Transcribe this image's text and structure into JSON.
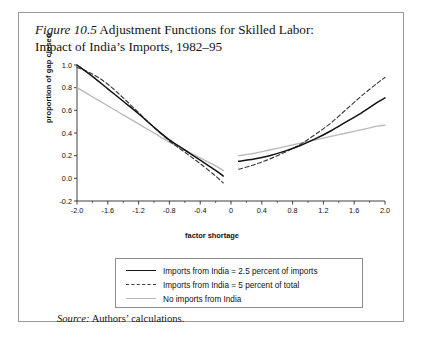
{
  "figure": {
    "number_label": "Figure 10.5",
    "title_line1": " Adjustment Functions for Skilled Labor:",
    "title_line2": "Impact of India’s Imports, 1982–95",
    "source_word": "Source:",
    "source_text": " Authors’ calculations."
  },
  "legend": {
    "items": [
      {
        "label": "Imports from India = 2.5 percent of imports",
        "style": "solid",
        "color": "#121212"
      },
      {
        "label": "Imports from India = 5 percent of total",
        "style": "dashed",
        "color": "#3a3a3a"
      },
      {
        "label": "No imports from India",
        "style": "solid",
        "color": "#b9b9b9"
      }
    ]
  },
  "chart_data": {
    "type": "line",
    "title": "Figure 10.5 Adjustment Functions for Skilled Labor: Impact of India’s Imports, 1982–95",
    "xlabel": "factor shortage",
    "ylabel": "proportion of gap closed",
    "xlim": [
      -2.0,
      2.0
    ],
    "ylim": [
      -0.2,
      1.0
    ],
    "xticks": [
      "-2.0",
      "-1.6",
      "-1.2",
      "-0.8",
      "-0.4",
      "0",
      "0.4",
      "0.8",
      "1.2",
      "1.6",
      "2.0"
    ],
    "xtick_values": [
      -2.0,
      -1.6,
      -1.2,
      -0.8,
      -0.4,
      0,
      0.4,
      0.8,
      1.2,
      1.6,
      2.0
    ],
    "yticks": [
      "-0.2",
      "0.0",
      "0.2",
      "0.4",
      "0.6",
      "0.8",
      "1.0"
    ],
    "ytick_values": [
      -0.2,
      0.0,
      0.2,
      0.4,
      0.6,
      0.8,
      1.0
    ],
    "grid": false,
    "legend_position": "below-plot",
    "discontinuity_at": 0,
    "note": "Each series is drawn as two separate branches with a gap around x = 0",
    "series": [
      {
        "name": "Imports from India = 2.5 percent of imports",
        "style": "solid",
        "color": "#121212",
        "branches": [
          {
            "x": [
              -2.0,
              -1.8,
              -1.6,
              -1.4,
              -1.2,
              -1.0,
              -0.8,
              -0.6,
              -0.4,
              -0.2,
              -0.1
            ],
            "y": [
              1.0,
              0.9,
              0.79,
              0.68,
              0.57,
              0.45,
              0.34,
              0.25,
              0.16,
              0.07,
              0.02
            ]
          },
          {
            "x": [
              0.1,
              0.3,
              0.5,
              0.7,
              0.9,
              1.1,
              1.3,
              1.5,
              1.7,
              1.9,
              2.0
            ],
            "y": [
              0.15,
              0.17,
              0.2,
              0.24,
              0.29,
              0.35,
              0.42,
              0.5,
              0.58,
              0.67,
              0.71
            ]
          }
        ]
      },
      {
        "name": "Imports from India = 5 percent of total",
        "style": "dashed",
        "color": "#3a3a3a",
        "branches": [
          {
            "x": [
              -2.0,
              -1.8,
              -1.6,
              -1.4,
              -1.2,
              -1.0,
              -0.8,
              -0.6,
              -0.4,
              -0.2,
              -0.1
            ],
            "y": [
              0.98,
              0.92,
              0.83,
              0.71,
              0.58,
              0.45,
              0.33,
              0.23,
              0.13,
              0.02,
              -0.04
            ]
          },
          {
            "x": [
              0.1,
              0.3,
              0.5,
              0.7,
              0.9,
              1.1,
              1.3,
              1.5,
              1.7,
              1.9,
              2.0
            ],
            "y": [
              0.08,
              0.12,
              0.17,
              0.23,
              0.3,
              0.39,
              0.49,
              0.61,
              0.73,
              0.84,
              0.89
            ]
          }
        ]
      },
      {
        "name": "No imports from India",
        "style": "solid",
        "color": "#b9b9b9",
        "branches": [
          {
            "x": [
              -2.0,
              -1.8,
              -1.6,
              -1.4,
              -1.2,
              -1.0,
              -0.8,
              -0.6,
              -0.4,
              -0.2,
              -0.1
            ],
            "y": [
              0.8,
              0.72,
              0.64,
              0.56,
              0.48,
              0.4,
              0.32,
              0.25,
              0.18,
              0.11,
              0.07
            ]
          },
          {
            "x": [
              0.1,
              0.3,
              0.5,
              0.7,
              0.9,
              1.1,
              1.3,
              1.5,
              1.7,
              1.9,
              2.0
            ],
            "y": [
              0.2,
              0.22,
              0.25,
              0.28,
              0.31,
              0.34,
              0.37,
              0.4,
              0.43,
              0.46,
              0.47
            ]
          }
        ]
      }
    ]
  }
}
